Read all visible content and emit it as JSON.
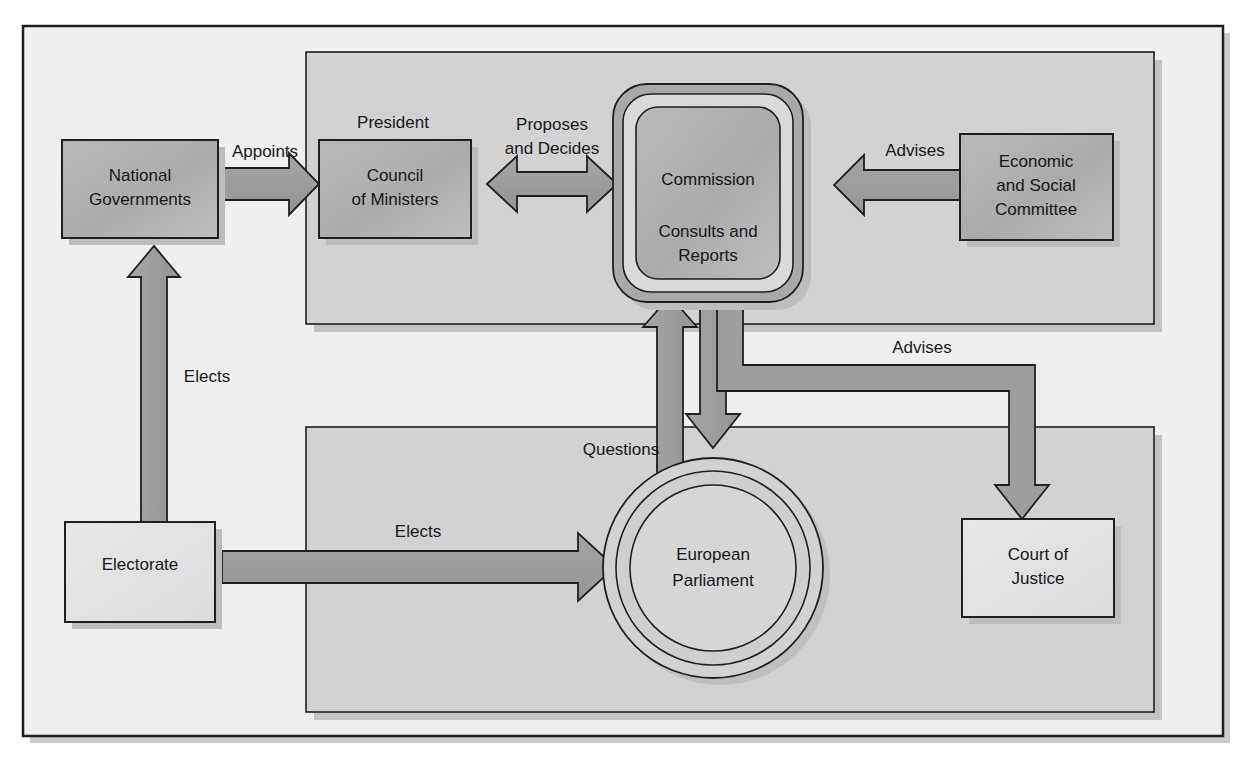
{
  "figure": {
    "background_color": "#ffffff",
    "frame_color": "#efefef",
    "panel_color": "#cfcfcf",
    "box_fill": "#b0b0b0",
    "box_fill_light": "#e8e8e8",
    "arrow_fill": "#9a9a9a",
    "line_color": "#1d1f21",
    "shadow_color": "#bdbdbd"
  },
  "panels": {
    "upper": {
      "name": "upper-grouping-panel"
    },
    "lower": {
      "name": "lower-grouping-panel"
    }
  },
  "nodes": {
    "national_governments": {
      "label_line1": "National",
      "label_line2": "Governments"
    },
    "council_of_ministers": {
      "caption": "President",
      "label_line1": "Council",
      "label_line2": "of Ministers"
    },
    "commission": {
      "label_line1": "Commission",
      "label_line2": "Consults and",
      "label_line3": "Reports"
    },
    "economic_social_committee": {
      "label_line1": "Economic",
      "label_line2": "and Social",
      "label_line3": "Committee"
    },
    "electorate": {
      "label_line1": "Electorate"
    },
    "european_parliament": {
      "label_line1": "European",
      "label_line2": "Parliament"
    },
    "court_of_justice": {
      "label_line1": "Court of",
      "label_line2": "Justice"
    }
  },
  "edges": {
    "appoints": {
      "label": "Appoints",
      "from": "National Governments",
      "to": "Council of Ministers",
      "direction": "right"
    },
    "proposes_and_decides": {
      "label_line1": "Proposes",
      "label_line2": "and Decides",
      "from": "Council of Ministers",
      "to": "Commission",
      "direction": "both"
    },
    "advises_esc": {
      "label": "Advises",
      "from": "Economic and Social Committee",
      "to": "Commission",
      "direction": "left"
    },
    "elects_national": {
      "label": "Elects",
      "from": "Electorate",
      "to": "National Governments",
      "direction": "up"
    },
    "elects_parliament": {
      "label": "Elects",
      "from": "Electorate",
      "to": "European Parliament",
      "direction": "right"
    },
    "questions": {
      "label": "Questions",
      "from": "European Parliament",
      "to": "Commission",
      "direction": "up"
    },
    "commission_to_parliament": {
      "label": "",
      "from": "Commission",
      "to": "European Parliament",
      "direction": "down"
    },
    "advises_court": {
      "label": "Advises",
      "from": "Commission",
      "to": "Court of Justice",
      "direction": "down"
    }
  }
}
